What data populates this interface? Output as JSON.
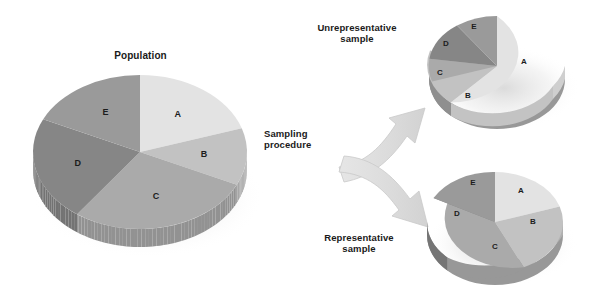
{
  "figure": {
    "title_population": "Population",
    "label_unrepresentative": "Unrepresentative\nsample",
    "label_representative": "Representative\nsample",
    "label_sampling": "Sampling\nprocedure",
    "background": "#ffffff",
    "text_color": "#1a1a1a",
    "arrow_color": "#dcdcdc",
    "arrow_edge_color": "#c4c4c4"
  },
  "palette": {
    "A": "#e3e3e3",
    "B": "#c2c2c2",
    "C": "#aaaaaa",
    "D": "#868686",
    "E": "#9a9a9a",
    "A_side": "#cfcfcf",
    "B_side": "#b0b0b0",
    "C_side": "#989898",
    "D_side": "#757575",
    "E_side": "#888888"
  },
  "chart_data": [
    {
      "type": "pie",
      "title": "Population",
      "id": "population",
      "categories": [
        "A",
        "B",
        "C",
        "D",
        "E"
      ],
      "values": [
        20,
        12,
        28,
        22,
        18
      ],
      "unit": "percent",
      "start_angle_deg": 0,
      "direction": "clockwise",
      "three_d": true,
      "center": [
        140,
        152
      ],
      "radius_x": 107,
      "radius_y": 77,
      "depth": 18,
      "colors": [
        "#e3e3e3",
        "#c2c2c2",
        "#aaaaaa",
        "#868686",
        "#9a9a9a"
      ],
      "labels_shown": [
        "A",
        "B",
        "C",
        "D",
        "E"
      ],
      "legend": "none",
      "grid": false
    },
    {
      "type": "pie",
      "title": "Unrepresentative sample",
      "id": "unrepresentative-sample",
      "categories": [
        "A",
        "B",
        "C",
        "D",
        "E"
      ],
      "values": [
        38,
        17,
        10,
        20,
        15
      ],
      "unit": "percent",
      "start_angle_deg": 0,
      "direction": "clockwise",
      "three_d": true,
      "center": [
        497,
        66
      ],
      "radius_x": 68,
      "radius_y": 50,
      "depth": 13,
      "colors": [
        "#e3e3e3",
        "#c2c2c2",
        "#aaaaaa",
        "#868686",
        "#9a9a9a"
      ],
      "labels_shown": [
        "A",
        "B",
        "C",
        "D",
        "E"
      ],
      "legend": "none",
      "grid": false
    },
    {
      "type": "pie",
      "title": "Representative sample",
      "id": "representative-sample",
      "categories": [
        "A",
        "B",
        "C",
        "D",
        "E"
      ],
      "values": [
        20,
        12,
        28,
        22,
        18
      ],
      "unit": "percent",
      "start_angle_deg": 0,
      "direction": "clockwise",
      "three_d": true,
      "center": [
        495,
        222
      ],
      "radius_x": 68,
      "radius_y": 50,
      "depth": 13,
      "colors": [
        "#e3e3e3",
        "#c2c2c2",
        "#aaaaaa",
        "#868686",
        "#9a9a9a"
      ],
      "labels_shown": [
        "A",
        "B",
        "C",
        "D",
        "E"
      ],
      "legend": "none",
      "grid": false
    }
  ]
}
